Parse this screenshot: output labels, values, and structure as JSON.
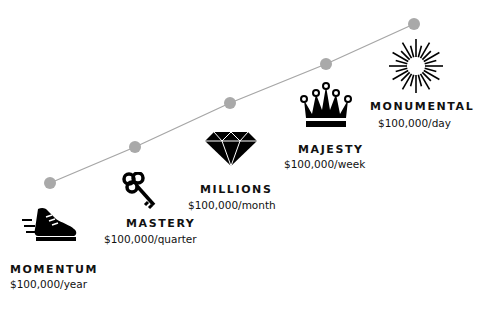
{
  "colors": {
    "line": "#a6a6a6",
    "dot": "#a9a9a9",
    "icon": "#000000",
    "text": "#111111"
  },
  "stages": [
    {
      "title": "MOMENTUM",
      "rate": "$100,000/year",
      "icon": "sneaker-icon"
    },
    {
      "title": "MASTERY",
      "rate": "$100,000/quarter",
      "icon": "key-icon"
    },
    {
      "title": "MILLIONS",
      "rate": "$100,000/month",
      "icon": "diamond-icon"
    },
    {
      "title": "MAJESTY",
      "rate": "$100,000/week",
      "icon": "crown-icon"
    },
    {
      "title": "MONUMENTAL",
      "rate": "$100,000/day",
      "icon": "starburst-icon"
    }
  ]
}
